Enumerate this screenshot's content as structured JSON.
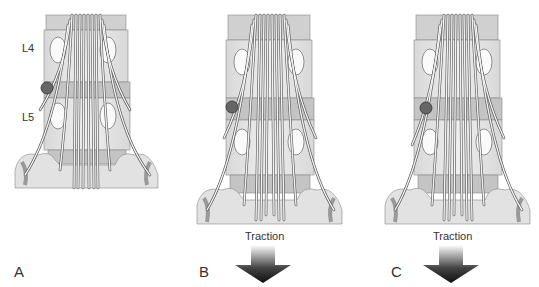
{
  "figure": {
    "colors": {
      "bone": "#e6e6e6",
      "disc": "#c4c4c4",
      "bone_shadow": "#9a9a9a",
      "nerve": "#f2f2f2",
      "nerve_outline": "#555555",
      "lesion": "#666666",
      "arrow_dark": "#222222"
    },
    "panels": [
      {
        "id": "A",
        "label": "A",
        "levels": [
          "L4",
          "L5"
        ],
        "traction": null
      },
      {
        "id": "B",
        "label": "B",
        "traction": "Traction"
      },
      {
        "id": "C",
        "label": "C",
        "traction": "Traction"
      }
    ]
  }
}
